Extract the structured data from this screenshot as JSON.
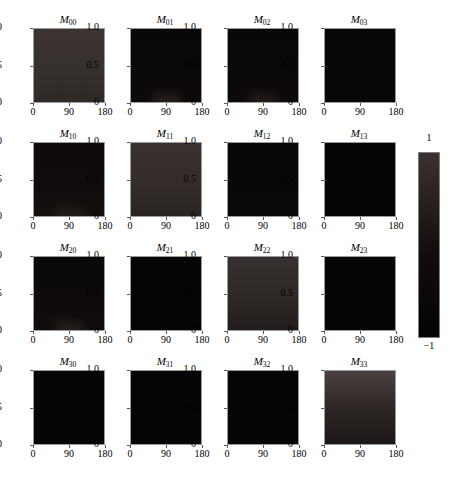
{
  "figure": {
    "name": "mueller-matrix-grid",
    "background": "#ffffff",
    "rows": 4,
    "cols": 4
  },
  "axis": {
    "xticks": [
      "0",
      "90",
      "180"
    ],
    "xtick_values": [
      0,
      90,
      180
    ],
    "yticks": [
      "1.0",
      "0.5",
      "0"
    ],
    "ytick_values": [
      1.0,
      0.5,
      0.0
    ],
    "xlim": [
      0,
      180
    ],
    "ylim": [
      0,
      1.0
    ]
  },
  "colorbar": {
    "name": "colorbar",
    "max_label": "1",
    "min_label": "−1",
    "max_value": 1,
    "min_value": -1,
    "top_color": "#3a3230",
    "mid_color": "#120d0c",
    "bottom_color": "#050303"
  },
  "chart_data": {
    "type": "heatmap",
    "title": "",
    "xlabel": "",
    "ylabel": "",
    "xlim": [
      0,
      180
    ],
    "ylim": [
      0,
      1
    ],
    "zlim": [
      -1,
      1
    ],
    "grid": false,
    "legend": "colorbar-right",
    "colormap": "black-to-dark-red (values -1 → 1)",
    "panels": [
      {
        "id": "M00",
        "row": 0,
        "col": 0,
        "label_base": "M",
        "label_sub": "00",
        "mean_value": 0.18,
        "base_color": "#36302e",
        "plume_color": "rgba(0,0,0,0)",
        "gradient": "uniform-dark-maroon, slight brighter at top",
        "top_color": "#3b3331",
        "bottom_color": "#2e2927"
      },
      {
        "id": "M01",
        "row": 0,
        "col": 1,
        "label_base": "M",
        "label_sub": "01",
        "mean_value": -0.9,
        "base_color": "#0a0707",
        "plume_color": "rgba(120,95,90,0.30)",
        "gradient": "near-black with faint lighter plume at bottom center",
        "top_color": "#080606",
        "bottom_color": "#0d0a09"
      },
      {
        "id": "M02",
        "row": 0,
        "col": 2,
        "label_base": "M",
        "label_sub": "02",
        "mean_value": -0.9,
        "base_color": "#0a0707",
        "plume_color": "rgba(120,95,90,0.26)",
        "gradient": "near-black with two faint plumes at bottom",
        "top_color": "#080606",
        "bottom_color": "#0d0a09"
      },
      {
        "id": "M03",
        "row": 0,
        "col": 3,
        "label_base": "M",
        "label_sub": "03",
        "mean_value": -0.95,
        "base_color": "#070505",
        "plume_color": "rgba(0,0,0,0)",
        "gradient": "uniform near-black",
        "top_color": "#070505",
        "bottom_color": "#070505"
      },
      {
        "id": "M10",
        "row": 1,
        "col": 0,
        "label_base": "M",
        "label_sub": "10",
        "mean_value": -0.85,
        "base_color": "#100c0b",
        "plume_color": "rgba(110,88,84,0.22)",
        "gradient": "dark with faint bottom plume",
        "top_color": "#0d0a09",
        "bottom_color": "#13100e"
      },
      {
        "id": "M11",
        "row": 1,
        "col": 1,
        "label_base": "M",
        "label_sub": "11",
        "mean_value": 0.14,
        "base_color": "#332c2a",
        "plume_color": "rgba(0,0,0,0)",
        "gradient": "dark maroon, slightly lighter toward top",
        "top_color": "#393230",
        "bottom_color": "#2a2523"
      },
      {
        "id": "M12",
        "row": 1,
        "col": 2,
        "label_base": "M",
        "label_sub": "12",
        "mean_value": -0.93,
        "base_color": "#080606",
        "plume_color": "rgba(0,0,0,0)",
        "gradient": "uniform near-black",
        "top_color": "#080606",
        "bottom_color": "#0a0808"
      },
      {
        "id": "M13",
        "row": 1,
        "col": 3,
        "label_base": "M",
        "label_sub": "13",
        "mean_value": -0.95,
        "base_color": "#060404",
        "plume_color": "rgba(0,0,0,0)",
        "gradient": "uniform near-black",
        "top_color": "#060404",
        "bottom_color": "#060404"
      },
      {
        "id": "M20",
        "row": 2,
        "col": 0,
        "label_base": "M",
        "label_sub": "20",
        "mean_value": -0.87,
        "base_color": "#0d0a09",
        "plume_color": "rgba(118,94,90,0.26)",
        "gradient": "near-black with two faint plumes near bottom",
        "top_color": "#0a0808",
        "bottom_color": "#110d0c"
      },
      {
        "id": "M21",
        "row": 2,
        "col": 1,
        "label_base": "M",
        "label_sub": "21",
        "mean_value": -0.95,
        "base_color": "#060404",
        "plume_color": "rgba(0,0,0,0)",
        "gradient": "uniform near-black",
        "top_color": "#060404",
        "bottom_color": "#060404"
      },
      {
        "id": "M22",
        "row": 2,
        "col": 2,
        "label_base": "M",
        "label_sub": "22",
        "mean_value": 0.1,
        "base_color": "#2e2826",
        "plume_color": "rgba(0,0,0,0)",
        "gradient": "dark maroon, lighter at top fading darker at bottom",
        "top_color": "#363030",
        "bottom_color": "#221d1c"
      },
      {
        "id": "M23",
        "row": 2,
        "col": 3,
        "label_base": "M",
        "label_sub": "23",
        "mean_value": -0.95,
        "base_color": "#060404",
        "plume_color": "rgba(0,0,0,0)",
        "gradient": "uniform near-black",
        "top_color": "#060404",
        "bottom_color": "#060404"
      },
      {
        "id": "M30",
        "row": 3,
        "col": 0,
        "label_base": "M",
        "label_sub": "30",
        "mean_value": -0.95,
        "base_color": "#060404",
        "plume_color": "rgba(0,0,0,0)",
        "gradient": "uniform near-black",
        "top_color": "#060404",
        "bottom_color": "#060404"
      },
      {
        "id": "M31",
        "row": 3,
        "col": 1,
        "label_base": "M",
        "label_sub": "31",
        "mean_value": -0.95,
        "base_color": "#060404",
        "plume_color": "rgba(0,0,0,0)",
        "gradient": "uniform near-black",
        "top_color": "#060404",
        "bottom_color": "#060404"
      },
      {
        "id": "M32",
        "row": 3,
        "col": 2,
        "label_base": "M",
        "label_sub": "32",
        "mean_value": -0.95,
        "base_color": "#060404",
        "plume_color": "rgba(0,0,0,0)",
        "gradient": "uniform near-black",
        "top_color": "#060404",
        "bottom_color": "#060404"
      },
      {
        "id": "M33",
        "row": 3,
        "col": 3,
        "label_base": "M",
        "label_sub": "33",
        "mean_value": 0.05,
        "base_color": "#2b2523",
        "plume_color": "rgba(0,0,0,0)",
        "gradient": "lighter maroon at top fading to dark at bottom",
        "top_color": "#4a4140",
        "bottom_color": "#1c1817"
      }
    ]
  }
}
